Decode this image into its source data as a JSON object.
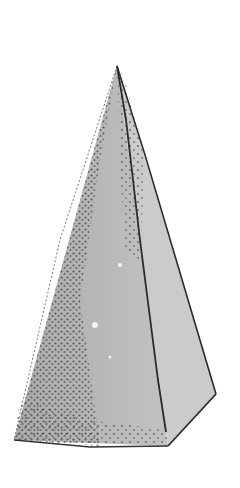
{
  "image": {
    "subject": "Stippled pencil illustration of a four-sided pyramid (obelisk-like) viewed from a low angle",
    "width": 240,
    "height": 488,
    "background": "#ffffff",
    "colors": {
      "face_left": "#b9b9b9",
      "face_front": "#c4c4c4",
      "face_right": "#c9c9c9",
      "edge": "#2a2a2a",
      "stipple": "#4a4a4a",
      "highlight": "#f2f2f2"
    },
    "geometry": {
      "apex": [
        117,
        66
      ],
      "back_left_base": [
        14,
        440
      ],
      "front_base": [
        168,
        446
      ],
      "right_base": [
        216,
        394
      ],
      "front_edge_end": [
        166,
        432
      ]
    }
  }
}
